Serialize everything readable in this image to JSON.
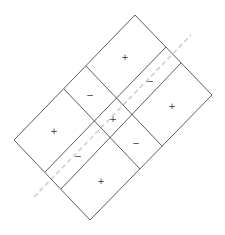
{
  "diagram": {
    "type": "sign-chart-grid",
    "colors": {
      "lines": "#333333",
      "dashed_line": "#d0d0d0",
      "background": "#ffffff"
    },
    "outline": {
      "top": [
        135,
        15
      ],
      "right": [
        212,
        95
      ],
      "bottom": [
        90,
        220
      ],
      "left": [
        14,
        140
      ]
    },
    "strip_lines": [
      {
        "from": [
          45,
          172
        ],
        "to": [
          166,
          47
        ]
      },
      {
        "from": [
          61,
          189
        ],
        "to": [
          181,
          63
        ]
      }
    ],
    "cross_lines": [
      {
        "from": [
          64,
          89
        ],
        "to": [
          140,
          169
        ]
      },
      {
        "from": [
          86,
          66
        ],
        "to": [
          162,
          146
        ]
      }
    ],
    "dashed_line": {
      "from": [
        34,
        197
      ],
      "to": [
        191,
        35
      ]
    },
    "regions": [
      {
        "id": "top-strip-right",
        "sign": "+",
        "pos": [
          125,
          57
        ]
      },
      {
        "id": "middle-strip-right",
        "sign": "−",
        "pos": [
          150,
          81
        ]
      },
      {
        "id": "bottom-strip-right",
        "sign": "+",
        "pos": [
          172,
          106
        ]
      },
      {
        "id": "top-strip-middle",
        "sign": "−",
        "pos": [
          90,
          95
        ]
      },
      {
        "id": "center",
        "sign": "+",
        "pos": [
          113,
          119
        ]
      },
      {
        "id": "bottom-strip-middle",
        "sign": "−",
        "pos": [
          136,
          143
        ]
      },
      {
        "id": "top-strip-left",
        "sign": "+",
        "pos": [
          54,
          131
        ]
      },
      {
        "id": "middle-strip-left",
        "sign": "−",
        "pos": [
          78,
          156
        ]
      },
      {
        "id": "bottom-strip-left",
        "sign": "+",
        "pos": [
          101,
          181
        ]
      }
    ]
  }
}
